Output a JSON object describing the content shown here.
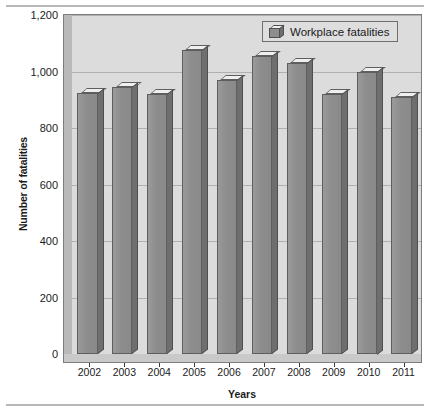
{
  "chart_data": {
    "type": "bar",
    "title": "",
    "xlabel": "Years",
    "ylabel": "Number of fatalities",
    "categories": [
      "2002",
      "2003",
      "2004",
      "2005",
      "2006",
      "2007",
      "2008",
      "2009",
      "2010",
      "2011"
    ],
    "series": [
      {
        "name": "Workplace fatalities",
        "values": [
          925,
          945,
          920,
          1075,
          970,
          1055,
          1030,
          920,
          1000,
          910
        ]
      }
    ],
    "ylim": [
      0,
      1200
    ],
    "yticks": [
      0,
      200,
      400,
      600,
      800,
      1000,
      1200
    ],
    "ytick_labels": [
      "0",
      "200",
      "400",
      "600",
      "800",
      "1,000",
      "1,200"
    ],
    "grid": true,
    "legend_position": "top-right",
    "colors": {
      "bar_front": "#8d8d8d",
      "bar_side": "#6e6e6e",
      "bar_top": "#efefef",
      "plot_background": "#dcdcdc",
      "gridline": "#b0b0b0",
      "axis": "#3a3a3a",
      "text": "#1b1b1b"
    }
  },
  "legend": {
    "entries": [
      {
        "label": "Workplace fatalities",
        "icon": "bar-swatch-3d-icon"
      }
    ]
  }
}
